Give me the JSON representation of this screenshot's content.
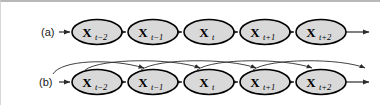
{
  "figure": {
    "type": "diagram",
    "subtype": "markov-chain-order-comparison",
    "width": 380,
    "height": 105,
    "background_color": "#ffffff",
    "node_fill_color": "#d9d9d9",
    "node_stroke_color": "#000000",
    "arrow_color": "#2b2b2b",
    "border_color": "#b8b8b8"
  },
  "panels": [
    {
      "id": "a",
      "label": "(a)",
      "description": "first-order Markov chain",
      "label_x": 40,
      "label_y": 32,
      "baseline_y": 30,
      "nodes": [
        {
          "id": "a0",
          "base": "X",
          "subscript": "t−2",
          "cx": 96,
          "cy": 30
        },
        {
          "id": "a1",
          "base": "X",
          "subscript": "t−1",
          "cx": 152,
          "cy": 30
        },
        {
          "id": "a2",
          "base": "X",
          "subscript": "t",
          "cx": 208,
          "cy": 30
        },
        {
          "id": "a3",
          "base": "X",
          "subscript": "t+1",
          "cx": 264,
          "cy": 30
        },
        {
          "id": "a4",
          "base": "X",
          "subscript": "t+2",
          "cx": 320,
          "cy": 30
        }
      ],
      "chain_edges": [
        {
          "from": "left-edge",
          "to": "a0"
        },
        {
          "from": "a0",
          "to": "a1"
        },
        {
          "from": "a1",
          "to": "a2"
        },
        {
          "from": "a2",
          "to": "a3"
        },
        {
          "from": "a3",
          "to": "a4"
        },
        {
          "from": "a4",
          "to": "right-edge"
        }
      ],
      "skip_edges": []
    },
    {
      "id": "b",
      "label": "(b)",
      "description": "second-order Markov chain",
      "label_x": 38,
      "label_y": 83,
      "baseline_y": 80,
      "nodes": [
        {
          "id": "b0",
          "base": "X",
          "subscript": "t−2",
          "cx": 96,
          "cy": 80
        },
        {
          "id": "b1",
          "base": "X",
          "subscript": "t−1",
          "cx": 152,
          "cy": 80
        },
        {
          "id": "b2",
          "base": "X",
          "subscript": "t",
          "cx": 208,
          "cy": 80
        },
        {
          "id": "b3",
          "base": "X",
          "subscript": "t+1",
          "cx": 264,
          "cy": 80
        },
        {
          "id": "b4",
          "base": "X",
          "subscript": "t+2",
          "cx": 320,
          "cy": 80
        }
      ],
      "chain_edges": [
        {
          "from": "left-edge",
          "to": "b0"
        },
        {
          "from": "b0",
          "to": "b1"
        },
        {
          "from": "b1",
          "to": "b2"
        },
        {
          "from": "b2",
          "to": "b3"
        },
        {
          "from": "b3",
          "to": "b4"
        },
        {
          "from": "b4",
          "to": "right-edge"
        }
      ],
      "skip_edges": [
        {
          "from": "left-edge",
          "to": "b1",
          "arc_apex_y": 60
        },
        {
          "from": "b0",
          "to": "b2",
          "arc_apex_y": 60
        },
        {
          "from": "b1",
          "to": "b3",
          "arc_apex_y": 60
        },
        {
          "from": "b2",
          "to": "b4",
          "arc_apex_y": 60
        },
        {
          "from": "b3",
          "to": "right-edge",
          "arc_apex_y": 60
        }
      ]
    }
  ],
  "geometry": {
    "node_rx": 25,
    "node_ry": 12.5,
    "left_stub_x": 58,
    "right_stub_x": 368
  }
}
